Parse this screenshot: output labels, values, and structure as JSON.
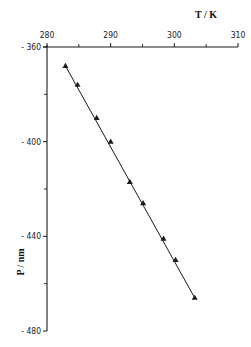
{
  "chart_data": {
    "type": "line",
    "title": "",
    "xlabel": "T / K",
    "ylabel": "P / nm",
    "xlim": [
      280,
      310
    ],
    "ylim": [
      -480,
      -360
    ],
    "x_ticks": [
      280,
      290,
      300,
      310
    ],
    "x_tick_labels": [
      "280",
      "290",
      "300",
      "310"
    ],
    "x_minor_ticks": [
      285,
      295,
      305
    ],
    "y_ticks": [
      -360,
      -400,
      -440,
      -480
    ],
    "y_tick_labels": [
      "-360",
      "-400",
      "-440",
      "-480"
    ],
    "y_minor_ticks": [
      -380,
      -420,
      -460
    ],
    "x_axis_position": "top",
    "grid": false,
    "legend": null,
    "marker": "triangle",
    "line_style": "solid line through points",
    "series": [
      {
        "name": "P vs T",
        "x": [
          282.9,
          284.8,
          287.8,
          290.0,
          293.0,
          295.1,
          298.3,
          300.2,
          303.2
        ],
        "y": [
          -368,
          -376,
          -390,
          -400,
          -417,
          -426,
          -441,
          -450,
          -466
        ]
      }
    ]
  },
  "labels": {
    "x_axis_title": "T / K",
    "y_axis_title": "P / nm"
  },
  "colors": {
    "ink": "#1a1a1a",
    "background": "#ffffff"
  }
}
